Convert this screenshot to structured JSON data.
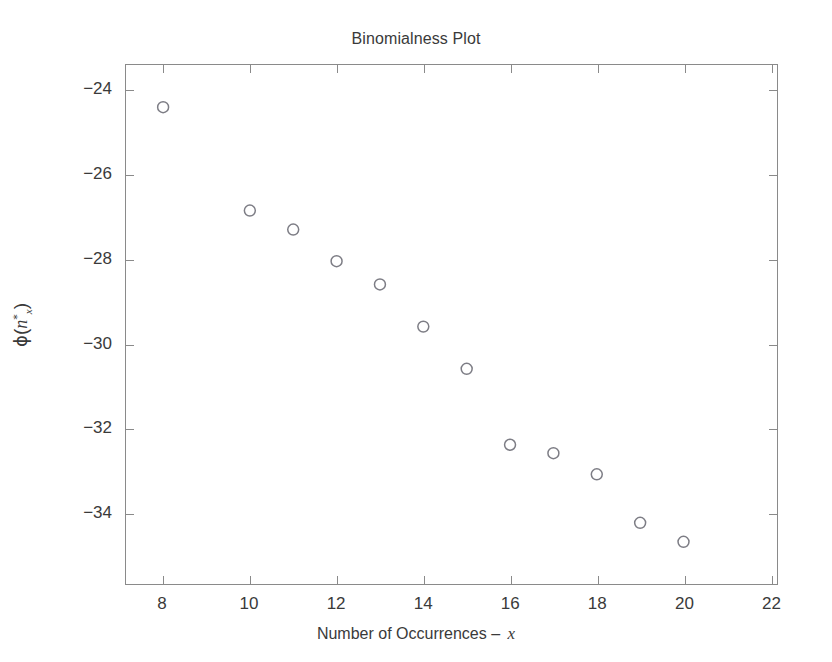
{
  "chart_data": {
    "type": "scatter",
    "title": "Binomialness Plot",
    "xlabel": "Number of Occurrences – ",
    "xlabel_variable": "x",
    "ylabel_parts": {
      "function": "ϕ",
      "open_paren": "(",
      "variable": "n",
      "superscript": "*",
      "subscript": "x",
      "close_paren": ")"
    },
    "ylabel_plain": "ϕ (n*x)",
    "x": [
      8,
      10,
      11,
      12,
      13,
      14,
      15,
      16,
      17,
      18,
      19,
      20
    ],
    "y": [
      -24.4,
      -26.85,
      -27.3,
      -28.05,
      -28.6,
      -29.6,
      -30.6,
      -32.4,
      -32.6,
      -33.1,
      -34.25,
      -34.7
    ],
    "points": [
      {
        "x": 8,
        "y": -24.4
      },
      {
        "x": 10,
        "y": -26.85
      },
      {
        "x": 11,
        "y": -27.3
      },
      {
        "x": 12,
        "y": -28.05
      },
      {
        "x": 13,
        "y": -28.6
      },
      {
        "x": 14,
        "y": -29.6
      },
      {
        "x": 15,
        "y": -30.6
      },
      {
        "x": 16,
        "y": -32.4
      },
      {
        "x": 17,
        "y": -32.6
      },
      {
        "x": 18,
        "y": -33.1
      },
      {
        "x": 19,
        "y": -34.25
      },
      {
        "x": 20,
        "y": -34.7
      }
    ],
    "xlim": [
      7.15,
      22.15
    ],
    "ylim": [
      -35.7,
      -23.4
    ],
    "xticks": [
      8,
      10,
      12,
      14,
      16,
      18,
      20,
      22
    ],
    "xticklabels": [
      "8",
      "10",
      "12",
      "14",
      "16",
      "18",
      "20",
      "22"
    ],
    "yticks": [
      -24,
      -26,
      -28,
      -30,
      -32,
      -34
    ],
    "yticklabels": [
      "−24",
      "−26",
      "−28",
      "−30",
      "−32",
      "−34"
    ],
    "grid": false,
    "legend": null,
    "marker": {
      "shape": "open-circle",
      "radius_px": 5.5,
      "edge_color": "#7d7d85",
      "face_color": "none"
    },
    "colors": {
      "background": "#ffffff",
      "axis": "#8a8a8a",
      "text": "#3a3a3a"
    }
  }
}
